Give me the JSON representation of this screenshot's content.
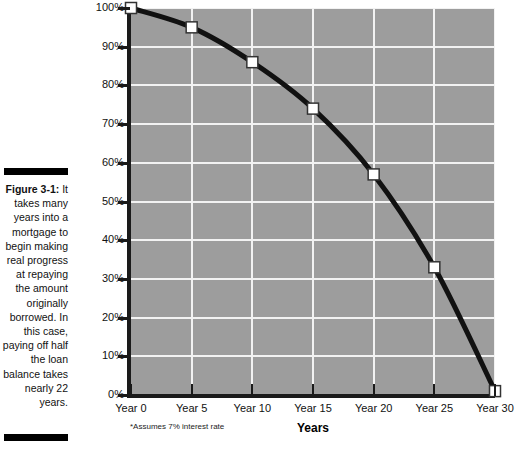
{
  "figure": {
    "label": "Figure 3-1:",
    "caption": " It takes many years into a mortgage to begin making real progress at repaying the amount originally borrowed. In this case, paying off half the loan balance takes nearly 22 years."
  },
  "chart_data": {
    "type": "line",
    "title": "",
    "xlabel": "Years",
    "ylabel": "Remaining balance in percent of original loan amount",
    "footnote": "*Assumes 7% interest rate",
    "categories": [
      "Year 0",
      "Year 5",
      "Year 10",
      "Year 15",
      "Year 20",
      "Year 25",
      "Year 30"
    ],
    "x": [
      0,
      5,
      10,
      15,
      20,
      25,
      30
    ],
    "values": [
      100,
      95,
      86,
      74,
      57,
      33,
      1
    ],
    "ylim": [
      0,
      100
    ],
    "xlim": [
      0,
      30
    ],
    "ytick_labels": [
      "100%",
      "90%",
      "80%",
      "70%",
      "60%",
      "50%",
      "40%",
      "30%",
      "20%",
      "10%",
      "0%"
    ],
    "ytick_values": [
      100,
      90,
      80,
      70,
      60,
      50,
      40,
      30,
      20,
      10,
      0
    ],
    "grid": true,
    "legend": "none",
    "marker": "white-square",
    "line_color": "#111111",
    "plot_background": "#9d9d9d",
    "gridline_color": "#f2f2f2"
  }
}
